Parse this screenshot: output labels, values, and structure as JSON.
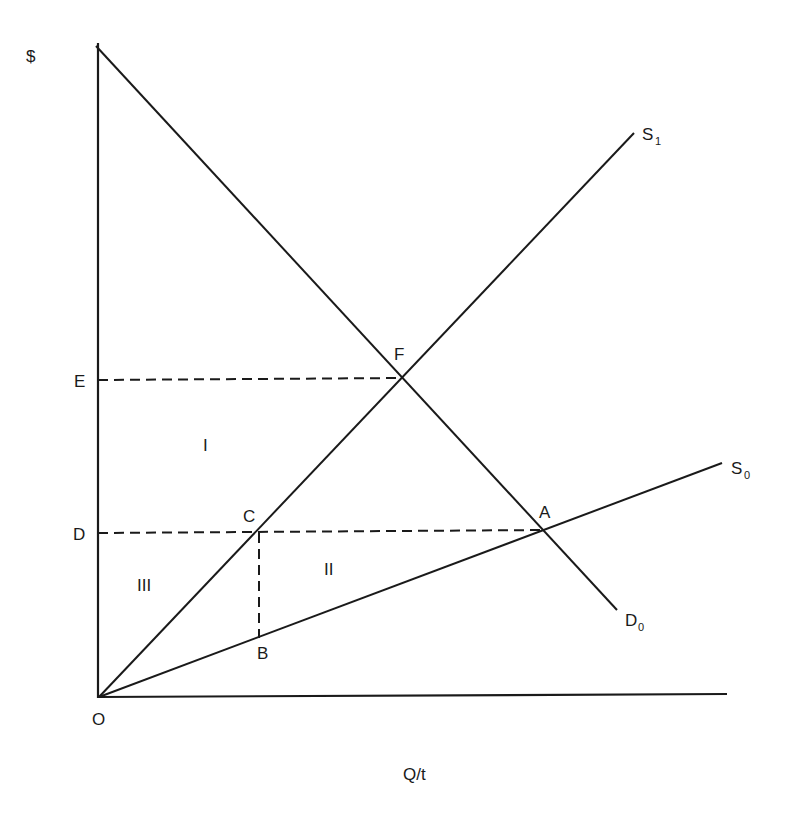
{
  "diagram": {
    "title": "",
    "y_axis_label": "$",
    "x_axis_label": "Q/t",
    "origin_label": "O",
    "curves": [
      {
        "id": "S1",
        "label": "S",
        "subscript": "1",
        "type": "supply"
      },
      {
        "id": "S0",
        "label": "S",
        "subscript": "0",
        "type": "supply"
      },
      {
        "id": "D0",
        "label": "D",
        "subscript": "0",
        "type": "demand"
      }
    ],
    "points": {
      "A": "A",
      "B": "B",
      "C": "C",
      "F": "F"
    },
    "price_levels": {
      "E": "E",
      "D": "D"
    },
    "regions": {
      "I": "I",
      "II": "II",
      "III": "III"
    }
  }
}
